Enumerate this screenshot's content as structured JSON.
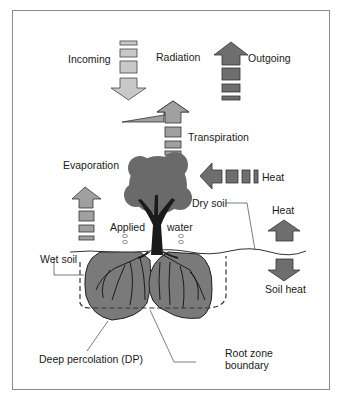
{
  "diagram": {
    "type": "soil-plant-atmosphere water and energy balance",
    "labels": {
      "incoming": "Incoming",
      "radiation": "Radiation",
      "outgoing": "Outgoing",
      "transpiration": "Transpiration",
      "evaporation": "Evaporation",
      "heat_canopy": "Heat",
      "dry_soil": "Dry soil",
      "heat_surface": "Heat",
      "applied": "Applied",
      "water": "water",
      "wet_soil": "Wet soil",
      "soil_heat": "Soil heat",
      "deep_percolation": "Deep percolation (DP)",
      "root_zone_line1": "Root zone",
      "root_zone_line2": "boundary"
    },
    "colors": {
      "light_arrow": "#c8c8c8",
      "medium_arrow": "#9a9a9a",
      "dark_arrow": "#6e6e6e",
      "soil_bulb": "#7a7a7a",
      "tree_crown": "#6a6a6a",
      "trunk": "#1a1a1a",
      "frame": "#8a8a8a"
    }
  }
}
